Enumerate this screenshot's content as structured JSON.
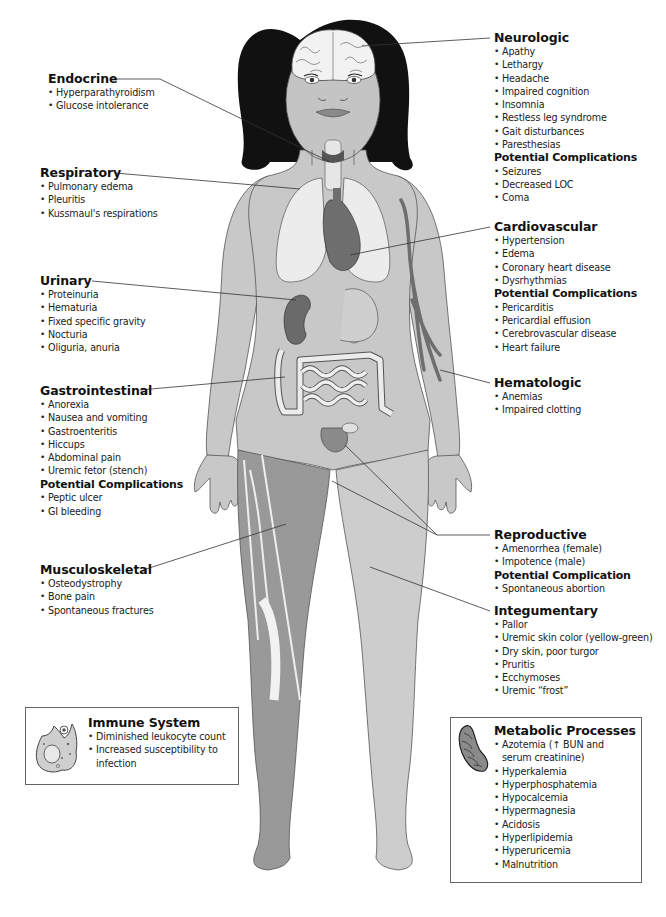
{
  "diagram": {
    "sections": {
      "endocrine": {
        "title": "Endocrine",
        "items": [
          "Hyperparathyroidism",
          "Glucose intolerance"
        ]
      },
      "respiratory": {
        "title": "Respiratory",
        "items": [
          "Pulmonary edema",
          "Pleuritis",
          "Kussmaul's respirations"
        ]
      },
      "urinary": {
        "title": "Urinary",
        "items": [
          "Proteinuria",
          "Hematuria",
          "Fixed specific gravity",
          "Nocturia",
          "Oliguria, anuria"
        ]
      },
      "gastrointestinal": {
        "title": "Gastrointestinal",
        "items": [
          "Anorexia",
          "Nausea and vomiting",
          "Gastroenteritis",
          "Hiccups",
          "Abdominal pain",
          "Uremic fetor (stench)"
        ],
        "complications_title": "Potential Complications",
        "complications": [
          "Peptic ulcer",
          "GI bleeding"
        ]
      },
      "musculoskeletal": {
        "title": "Musculoskeletal",
        "items": [
          "Osteodystrophy",
          "Bone pain",
          "Spontaneous fractures"
        ]
      },
      "immune": {
        "title": "Immune System",
        "items": [
          "Diminished leukocyte count",
          "Increased susceptibility to infection"
        ]
      },
      "neurologic": {
        "title": "Neurologic",
        "items": [
          "Apathy",
          "Lethargy",
          "Headache",
          "Impaired cognition",
          "Insomnia",
          "Restless leg syndrome",
          "Gait disturbances",
          "Paresthesias"
        ],
        "complications_title": "Potential Complications",
        "complications": [
          "Seizures",
          "Decreased LOC",
          "Coma"
        ]
      },
      "cardiovascular": {
        "title": "Cardiovascular",
        "items": [
          "Hypertension",
          "Edema",
          "Coronary heart disease",
          "Dysrhythmias"
        ],
        "complications_title": "Potential Complications",
        "complications": [
          "Pericarditis",
          "Pericardial effusion",
          "Cerebrovascular disease",
          "Heart failure"
        ]
      },
      "hematologic": {
        "title": "Hematologic",
        "items": [
          "Anemias",
          "Impaired clotting"
        ]
      },
      "reproductive": {
        "title": "Reproductive",
        "items": [
          "Amenorrhea (female)",
          "Impotence (male)"
        ],
        "complications_title": "Potential Complication",
        "complications": [
          "Spontaneous abortion"
        ]
      },
      "integumentary": {
        "title": "Integumentary",
        "items": [
          "Pallor",
          "Uremic skin color (yellow-green)",
          "Dry skin, poor turgor",
          "Pruritis",
          "Ecchymoses",
          "Uremic “frost”"
        ]
      },
      "metabolic": {
        "title": "Metabolic Processes",
        "items": [
          "Azotemia (↑ BUN and serum creatinine)",
          "Hyperkalemia",
          "Hyperphosphatemia",
          "Hypocalcemia",
          "Hypermagnesia",
          "Acidosis",
          "Hyperlipidemia",
          "Hyperuricemia",
          "Malnutrition"
        ]
      }
    },
    "colors": {
      "skin": "#c8c8c8",
      "skin_light": "#d6d6d6",
      "organ_dark": "#6e6e6e",
      "lung": "#ececec",
      "hair": "#111111",
      "leader_line": "#333333",
      "box_border": "#666666"
    }
  }
}
